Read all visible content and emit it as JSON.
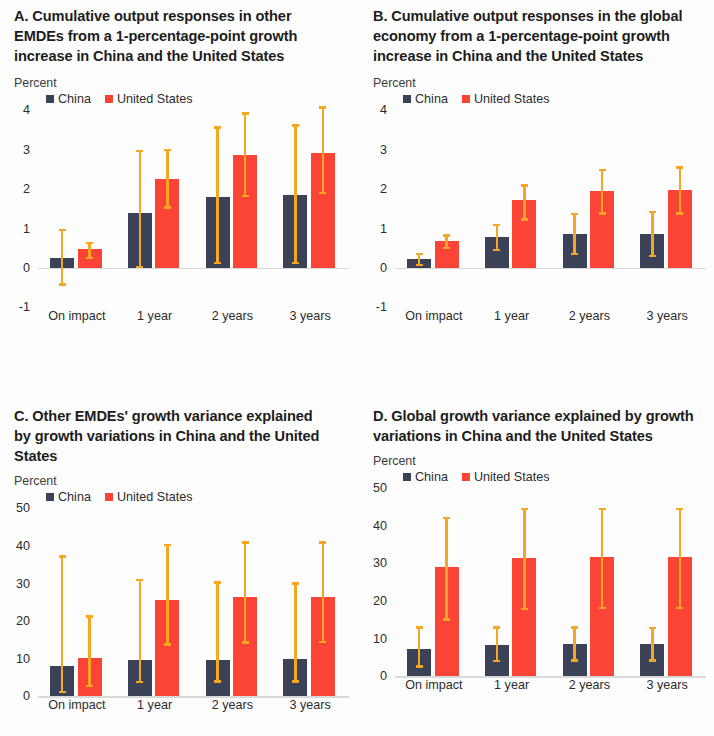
{
  "figure": {
    "legend": {
      "china": "China",
      "united_states": "United States"
    },
    "axis_unit": "Percent",
    "colors": {
      "china": "#3b4257",
      "united_states": "#fb4336",
      "error_bar": "#f5a623",
      "zero_line": "#d9d9da",
      "text": "#231f20",
      "background": "#ffffff"
    }
  },
  "panels": {
    "a": {
      "title": "A. Cumulative output responses in other EMDEs from a 1-percentage-point growth increase in China and the United States",
      "unit": "Percent",
      "yticks": [
        "4",
        "3",
        "2",
        "1",
        "0",
        "-1"
      ],
      "xlabels": [
        "On impact",
        "1 year",
        "2 years",
        "3 years"
      ]
    },
    "b": {
      "title": "B. Cumulative output responses in the global economy from a 1-percentage-point growth increase in China and the United States",
      "unit": "Percent",
      "yticks": [
        "4",
        "3",
        "2",
        "1",
        "0",
        "-1"
      ],
      "xlabels": [
        "On impact",
        "1 year",
        "2 years",
        "3 years"
      ]
    },
    "c": {
      "title": "C. Other EMDEs' growth variance explained by growth variations in China and the United States",
      "unit": "Percent",
      "yticks": [
        "50",
        "40",
        "30",
        "20",
        "10",
        "0"
      ],
      "xlabels": [
        "On impact",
        "1 year",
        "2 years",
        "3 years"
      ]
    },
    "d": {
      "title": "D. Global growth variance explained by growth variations in China and the United States",
      "unit": "Percent",
      "yticks": [
        "50",
        "40",
        "30",
        "20",
        "10",
        "0"
      ],
      "xlabels": [
        "On impact",
        "1 year",
        "2 years",
        "3 years"
      ]
    }
  },
  "chart_data": [
    {
      "panel": "A",
      "type": "bar",
      "title": "A. Cumulative output responses in other EMDEs from a 1-percentage-point growth increase in China and the United States",
      "ylabel": "Percent",
      "xlabel": "",
      "ylim": [
        -1,
        4
      ],
      "yticks": [
        -1,
        0,
        1,
        2,
        3,
        4
      ],
      "grid": false,
      "legend_position": "top",
      "categories": [
        "On impact",
        "1 year",
        "2 years",
        "3 years"
      ],
      "series": [
        {
          "name": "China",
          "color": "#3b4257",
          "values": [
            0.25,
            1.4,
            1.8,
            1.85
          ],
          "error_low": [
            -0.45,
            0.0,
            0.1,
            0.1
          ],
          "error_high": [
            1.0,
            3.0,
            3.6,
            3.65
          ]
        },
        {
          "name": "United States",
          "color": "#fb4336",
          "values": [
            0.47,
            2.27,
            2.87,
            2.93
          ],
          "error_low": [
            0.22,
            1.5,
            1.8,
            1.87
          ],
          "error_high": [
            0.67,
            3.02,
            3.95,
            4.1
          ]
        }
      ]
    },
    {
      "panel": "B",
      "type": "bar",
      "title": "B. Cumulative output responses in the global economy from a 1-percentage-point growth increase in China and the United States",
      "ylabel": "Percent",
      "xlabel": "",
      "ylim": [
        -1,
        4
      ],
      "yticks": [
        -1,
        0,
        1,
        2,
        3,
        4
      ],
      "grid": false,
      "legend_position": "top",
      "categories": [
        "On impact",
        "1 year",
        "2 years",
        "3 years"
      ],
      "series": [
        {
          "name": "China",
          "color": "#3b4257",
          "values": [
            0.22,
            0.78,
            0.87,
            0.87
          ],
          "error_low": [
            0.05,
            0.42,
            0.33,
            0.28
          ],
          "error_high": [
            0.38,
            1.12,
            1.4,
            1.45
          ]
        },
        {
          "name": "United States",
          "color": "#fb4336",
          "values": [
            0.68,
            1.72,
            1.95,
            1.98
          ],
          "error_low": [
            0.48,
            1.2,
            1.35,
            1.35
          ],
          "error_high": [
            0.85,
            2.12,
            2.52,
            2.58
          ]
        }
      ]
    },
    {
      "panel": "C",
      "type": "bar",
      "title": "C. Other EMDEs' growth variance explained by growth variations in China and the United States",
      "ylabel": "Percent",
      "xlabel": "",
      "ylim": [
        0,
        50
      ],
      "yticks": [
        0,
        10,
        20,
        30,
        40,
        50
      ],
      "grid": false,
      "legend_position": "top",
      "categories": [
        "On impact",
        "1 year",
        "2 years",
        "3 years"
      ],
      "series": [
        {
          "name": "China",
          "color": "#3b4257",
          "values": [
            8.2,
            9.7,
            9.8,
            9.9
          ],
          "error_low": [
            0.8,
            3.5,
            3.6,
            3.6
          ],
          "error_high": [
            37.5,
            31.3,
            30.6,
            30.3
          ]
        },
        {
          "name": "United States",
          "color": "#fb4336",
          "values": [
            10.2,
            25.7,
            26.4,
            26.5
          ],
          "error_low": [
            2.4,
            13.5,
            14.0,
            14.2
          ],
          "error_high": [
            21.6,
            40.5,
            41.2,
            41.2
          ]
        }
      ]
    },
    {
      "panel": "D",
      "type": "bar",
      "title": "D. Global growth variance explained by growth variations in China and the United States",
      "ylabel": "Percent",
      "xlabel": "",
      "ylim": [
        0,
        50
      ],
      "yticks": [
        0,
        10,
        20,
        30,
        40,
        50
      ],
      "grid": false,
      "legend_position": "top",
      "categories": [
        "On impact",
        "1 year",
        "2 years",
        "3 years"
      ],
      "series": [
        {
          "name": "China",
          "color": "#3b4257",
          "values": [
            7.3,
            8.4,
            8.5,
            8.5
          ],
          "error_low": [
            2.3,
            3.8,
            3.9,
            3.9
          ],
          "error_high": [
            13.3,
            13.3,
            13.3,
            13.2
          ]
        },
        {
          "name": "United States",
          "color": "#fb4336",
          "values": [
            29.0,
            31.5,
            31.6,
            31.6
          ],
          "error_low": [
            14.8,
            17.6,
            17.9,
            17.9
          ],
          "error_high": [
            42.4,
            44.8,
            44.8,
            44.8
          ]
        }
      ]
    }
  ]
}
